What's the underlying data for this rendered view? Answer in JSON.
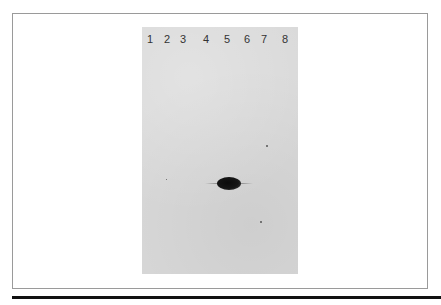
{
  "figure": {
    "type": "gel electrophoresis photograph",
    "lanes": [
      {
        "label": "1",
        "x": 150
      },
      {
        "label": "2",
        "x": 167
      },
      {
        "label": "3",
        "x": 183
      },
      {
        "label": "4",
        "x": 206
      },
      {
        "label": "5",
        "x": 227
      },
      {
        "label": "6",
        "x": 247
      },
      {
        "label": "7",
        "x": 264
      },
      {
        "label": "8",
        "x": 285
      }
    ],
    "band": {
      "lane": "5",
      "description": "single dark band"
    },
    "colors": {
      "gel": "#d9d9d9",
      "band": "#111111",
      "frame_border": "#9a9a9a",
      "rule": "#111111"
    }
  },
  "caption": {
    "visible_text": ""
  }
}
